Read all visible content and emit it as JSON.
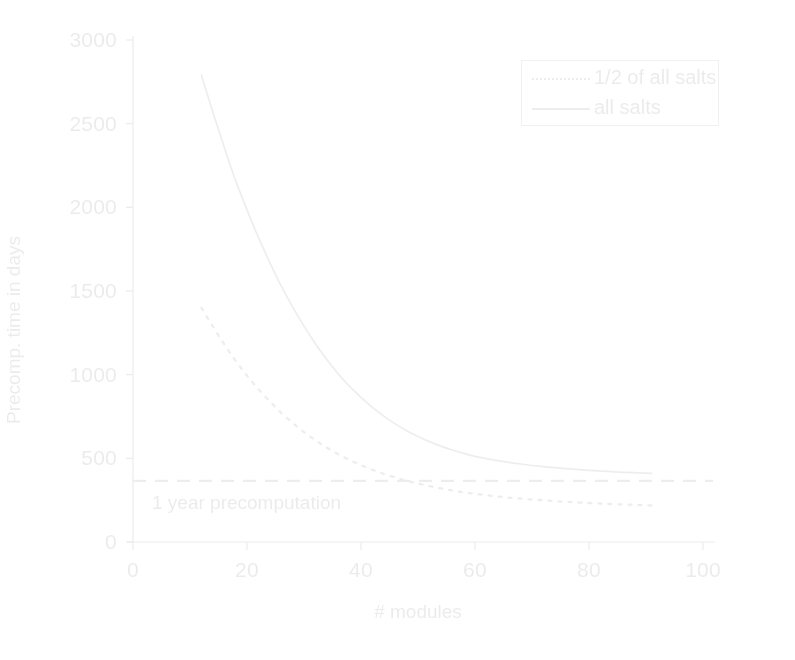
{
  "chart_data": {
    "type": "line",
    "title": "",
    "subtitle": "",
    "xlabel": "# modules",
    "ylabel": "Precomp. time in days",
    "xlim": [
      0,
      100
    ],
    "ylim": [
      0,
      3000
    ],
    "xticks": [
      "0",
      "20",
      "40",
      "60",
      "80",
      "100"
    ],
    "xtick_values": [
      0,
      20,
      40,
      60,
      80,
      100
    ],
    "yticks": [
      "0",
      "500",
      "1000",
      "1500",
      "2000",
      "2500",
      "3000"
    ],
    "ytick_values": [
      0,
      500,
      1000,
      1500,
      2000,
      2500,
      3000
    ],
    "grid": false,
    "legend_position": "top-right",
    "legend_entries": [
      {
        "label": "1/2 of all salts",
        "style": "dotted"
      },
      {
        "label": "all salts",
        "style": "solid"
      }
    ],
    "series": [
      {
        "name": "all salts",
        "style": "solid",
        "color": "#6a6d72",
        "x": [
          12,
          14,
          16,
          18,
          20,
          22,
          24,
          26,
          28,
          30,
          32,
          34,
          36,
          38,
          40,
          42,
          44,
          46,
          48,
          50,
          52,
          54,
          56,
          58,
          60,
          64,
          68,
          72,
          76,
          80,
          84,
          88,
          91
        ],
        "values": [
          2790,
          2570,
          2360,
          2160,
          1985,
          1820,
          1670,
          1530,
          1405,
          1290,
          1185,
          1090,
          1005,
          930,
          865,
          805,
          752,
          706,
          665,
          630,
          600,
          573,
          550,
          530,
          512,
          486,
          466,
          450,
          438,
          428,
          420,
          414,
          410
        ]
      },
      {
        "name": "1/2 of all salts",
        "style": "dotted",
        "color": "#6a6d72",
        "x": [
          12,
          14,
          16,
          18,
          20,
          22,
          24,
          26,
          28,
          30,
          32,
          34,
          36,
          38,
          40,
          42,
          44,
          46,
          48,
          50,
          52,
          54,
          56,
          58,
          60,
          64,
          68,
          72,
          76,
          80,
          84,
          88,
          91
        ],
        "values": [
          1400,
          1288,
          1182,
          1084,
          995,
          914,
          840,
          772,
          712,
          657,
          608,
          564,
          525,
          490,
          459,
          432,
          407,
          386,
          366,
          349,
          334,
          320,
          308,
          297,
          288,
          272,
          259,
          249,
          240,
          233,
          227,
          222,
          218
        ]
      }
    ],
    "annotations": [
      {
        "type": "hline",
        "label": "1 year precomputation",
        "y": 365,
        "style": "dashed",
        "color": "#6a6d72"
      }
    ]
  },
  "axis_title": {
    "x": "# modules",
    "y": "Precomp. time in days"
  },
  "threshold": {
    "label": "1 year precomputation"
  },
  "legend": {
    "items": [
      {
        "label": "1/2 of all salts"
      },
      {
        "label": "all salts"
      }
    ]
  },
  "colors": {
    "ink": "#55585c",
    "line": "#6a6d72",
    "background": "#ffffff"
  }
}
